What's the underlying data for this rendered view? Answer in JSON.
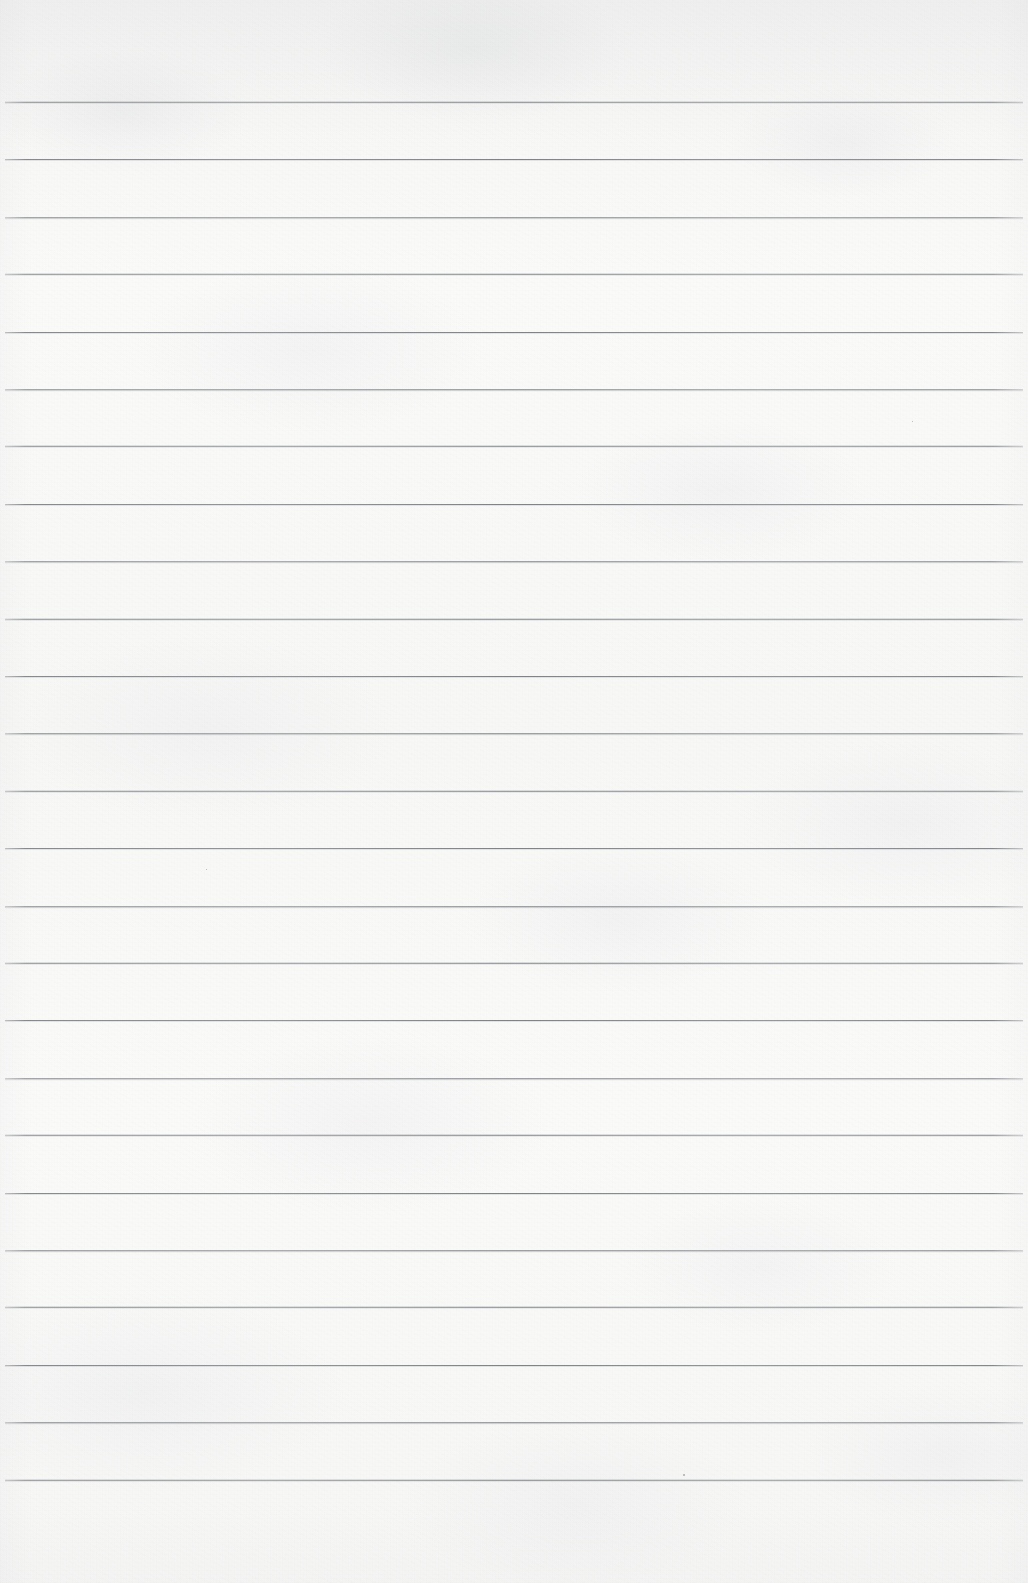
{
  "document": {
    "kind": "ruled-notebook-page",
    "title": "Blank lined notebook page",
    "content_text": "",
    "page_width": 1028,
    "page_height": 1583
  },
  "paper": {
    "base_color": "#f8f8f7",
    "highlight_color": "#fafaf9",
    "shadow_color": "#f5f5f4",
    "texture": "mottled scanned paper grain"
  },
  "rules": {
    "line_color": "#7c8085",
    "line_count": 25,
    "first_line_y": 102,
    "line_spacing": 57.4,
    "line_start_x": 5,
    "line_end_x": 1023,
    "line_thickness": 1,
    "top_margin": 102,
    "bottom_margin": 103,
    "lines_y": [
      102,
      159.4,
      216.8,
      274.2,
      331.6,
      389,
      446.4,
      503.8,
      561.2,
      618.6,
      676,
      733.4,
      790.8,
      848.2,
      905.6,
      963,
      1020.4,
      1077.8,
      1135.2,
      1192.6,
      1250,
      1307.4,
      1364.8,
      1422.2,
      1479.6
    ]
  },
  "marks": {
    "specks": [
      {
        "x": 683,
        "y": 1474,
        "size": 2
      },
      {
        "x": 912,
        "y": 421,
        "size": 1
      },
      {
        "x": 206,
        "y": 869,
        "size": 1
      }
    ]
  }
}
